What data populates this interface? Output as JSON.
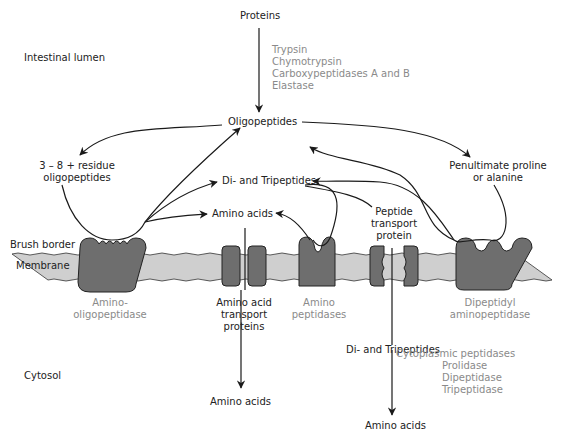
{
  "regions": {
    "lumen": "Intestinal lumen",
    "brush_border": "Brush border",
    "membrane": "Membrane",
    "cytosol": "Cytosol"
  },
  "nodes": {
    "proteins": "Proteins",
    "oligopeptides": "Oligopeptides",
    "residue_oligopeptides_line1": "3 – 8 + residue",
    "residue_oligopeptides_line2": "oligopeptides",
    "di_tripeptides_lumen": "Di- and Tripeptides",
    "amino_acids_lumen": "Amino acids",
    "penultimate_line1": "Penultimate proline",
    "penultimate_line2": "or alanine",
    "peptide_transport_line1": "Peptide",
    "peptide_transport_line2": "transport",
    "peptide_transport_line3": "protein",
    "di_tripeptides_cytosol": "Di- and Tripeptides",
    "amino_acids_cytosol_left": "Amino acids",
    "amino_acids_cytosol_right": "Amino acids"
  },
  "pancreatic_enzymes": [
    "Trypsin",
    "Chymotrypsin",
    "Carboxypeptidases A and B",
    "Elastase"
  ],
  "membrane_proteins": {
    "amino_oligopeptidase_line1": "Amino-",
    "amino_oligopeptidase_line2": "oligopeptidase",
    "aa_transport_line1": "Amino acid",
    "aa_transport_line2": "transport",
    "aa_transport_line3": "proteins",
    "amino_peptidases_line1": "Amino",
    "amino_peptidases_line2": "peptidases",
    "dipeptidyl_line1": "Dipeptidyl",
    "dipeptidyl_line2": "aminopeptidase"
  },
  "cytoplasmic": {
    "title": "Cytoplasmic peptidases",
    "items": [
      "Prolidase",
      "Dipeptidase",
      "Tripeptidase"
    ]
  },
  "colors": {
    "membrane_fill": "#cfcfcf",
    "protein_fill": "#6e6e6e",
    "line": "#1a1a1a",
    "enzyme_text": "#8a8a8a"
  }
}
